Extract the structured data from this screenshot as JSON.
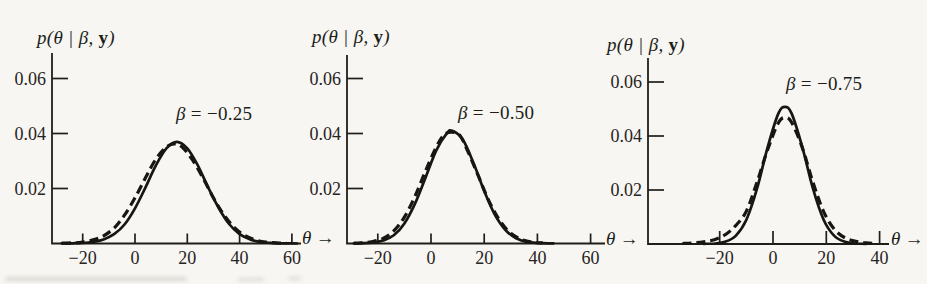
{
  "figure": {
    "background_color": "#f7f6f2",
    "ink_color": "#211e1a"
  },
  "chart_data": [
    {
      "type": "line",
      "title": "",
      "ylabel": "p(θ | β, y)",
      "xlabel": "θ →",
      "annotation": "β = −0.25",
      "grid": false,
      "legend": "none",
      "x_ticks": [
        -20,
        0,
        20,
        40,
        60
      ],
      "x_tick_labels": [
        "−20",
        "0",
        "20",
        "40",
        "60"
      ],
      "y_ticks": [
        0.02,
        0.04,
        0.06
      ],
      "y_tick_labels": [
        "0.02",
        "0.04",
        "0.06"
      ],
      "xlim": [
        -31,
        63
      ],
      "ylim": [
        0,
        0.069
      ],
      "labels": {
        "ylabel_prefix": "p(θ | β, ",
        "ylabel_bold": "y",
        "ylabel_suffix": ")",
        "annotation_sym": "β",
        "annotation_rest": " = −0.25",
        "x_arrow_sym": "θ",
        "x_arrow": "→"
      },
      "series": [
        {
          "name": "dashed-curve",
          "style": "dashed",
          "points": [
            [
              -28,
              0.0001
            ],
            [
              -24,
              0.0002
            ],
            [
              -20,
              0.0005
            ],
            [
              -16,
              0.0013
            ],
            [
              -12,
              0.0028
            ],
            [
              -8,
              0.0056
            ],
            [
              -4,
              0.0103
            ],
            [
              0,
              0.0166
            ],
            [
              4,
              0.0239
            ],
            [
              8,
              0.0307
            ],
            [
              12,
              0.0351
            ],
            [
              15,
              0.0362
            ],
            [
              18,
              0.0351
            ],
            [
              22,
              0.0304
            ],
            [
              26,
              0.0238
            ],
            [
              30,
              0.0166
            ],
            [
              34,
              0.0104
            ],
            [
              38,
              0.0058
            ],
            [
              42,
              0.0029
            ],
            [
              46,
              0.0013
            ],
            [
              50,
              0.0005
            ],
            [
              54,
              0.0002
            ],
            [
              58,
              6e-05
            ]
          ]
        },
        {
          "name": "solid-curve",
          "style": "solid",
          "points": [
            [
              -28,
              2e-05
            ],
            [
              -24,
              7e-05
            ],
            [
              -20,
              0.00018
            ],
            [
              -16,
              0.0006
            ],
            [
              -12,
              0.0015
            ],
            [
              -8,
              0.0034
            ],
            [
              -4,
              0.0069
            ],
            [
              0,
              0.0128
            ],
            [
              4,
              0.0204
            ],
            [
              8,
              0.0284
            ],
            [
              12,
              0.0346
            ],
            [
              16,
              0.037
            ],
            [
              20,
              0.0346
            ],
            [
              24,
              0.0284
            ],
            [
              28,
              0.0204
            ],
            [
              32,
              0.0129
            ],
            [
              36,
              0.0071
            ],
            [
              40,
              0.0034
            ],
            [
              44,
              0.0015
            ],
            [
              48,
              0.0005
            ],
            [
              52,
              0.0002
            ],
            [
              56,
              6e-05
            ],
            [
              60,
              2e-05
            ],
            [
              62,
              1e-05
            ]
          ]
        }
      ]
    },
    {
      "type": "line",
      "title": "",
      "ylabel": "p(θ | β, y)",
      "xlabel": "θ →",
      "annotation": "β = −0.50",
      "grid": false,
      "legend": "none",
      "x_ticks": [
        -20,
        0,
        20,
        40,
        60
      ],
      "x_tick_labels": [
        "−20",
        "0",
        "20",
        "40",
        "60"
      ],
      "y_ticks": [
        0.02,
        0.04,
        0.06
      ],
      "y_tick_labels": [
        "0.02",
        "0.04",
        "0.06"
      ],
      "xlim": [
        -31,
        65
      ],
      "ylim": [
        0,
        0.069
      ],
      "labels": {
        "ylabel_prefix": "p(θ | β, ",
        "ylabel_bold": "y",
        "ylabel_suffix": ")",
        "annotation_sym": "β",
        "annotation_rest": " = −0.50",
        "x_arrow_sym": "θ",
        "x_arrow": "→"
      },
      "series": [
        {
          "name": "dashed-curve",
          "style": "dashed",
          "points": [
            [
              -29,
              0.0001
            ],
            [
              -26,
              0.0002
            ],
            [
              -22,
              0.0007
            ],
            [
              -18,
              0.0019
            ],
            [
              -14,
              0.0046
            ],
            [
              -10,
              0.0096
            ],
            [
              -6,
              0.0172
            ],
            [
              -2,
              0.0265
            ],
            [
              2,
              0.0351
            ],
            [
              5,
              0.0396
            ],
            [
              8,
              0.0405
            ],
            [
              11,
              0.0391
            ],
            [
              14,
              0.0332
            ],
            [
              18,
              0.0241
            ],
            [
              22,
              0.015
            ],
            [
              26,
              0.0081
            ],
            [
              30,
              0.0037
            ],
            [
              34,
              0.0015
            ],
            [
              38,
              0.0005
            ],
            [
              42,
              0.0002
            ]
          ]
        },
        {
          "name": "solid-curve",
          "style": "solid",
          "points": [
            [
              -29,
              5e-05
            ],
            [
              -26,
              0.0001
            ],
            [
              -22,
              0.0003
            ],
            [
              -18,
              0.0011
            ],
            [
              -14,
              0.003
            ],
            [
              -10,
              0.0073
            ],
            [
              -6,
              0.0145
            ],
            [
              -2,
              0.0241
            ],
            [
              2,
              0.0339
            ],
            [
              6,
              0.0401
            ],
            [
              8,
              0.041
            ],
            [
              12,
              0.0377
            ],
            [
              16,
              0.0292
            ],
            [
              20,
              0.0191
            ],
            [
              24,
              0.0105
            ],
            [
              28,
              0.0049
            ],
            [
              32,
              0.0019
            ],
            [
              36,
              0.0006
            ],
            [
              40,
              0.0002
            ],
            [
              44,
              6e-05
            ],
            [
              46,
              3e-05
            ]
          ]
        }
      ]
    },
    {
      "type": "line",
      "title": "",
      "ylabel": "p(θ | β, y)",
      "xlabel": "θ →",
      "annotation": "β = −0.75",
      "grid": false,
      "legend": "none",
      "x_ticks": [
        -20,
        0,
        20,
        40
      ],
      "x_tick_labels": [
        "−20",
        "0",
        "20",
        "40"
      ],
      "y_ticks": [
        0.02,
        0.04,
        0.06
      ],
      "y_tick_labels": [
        "0.02",
        "0.04",
        "0.06"
      ],
      "xlim": [
        -47,
        43
      ],
      "ylim": [
        0,
        0.069
      ],
      "labels": {
        "ylabel_prefix": "p(θ | β, ",
        "ylabel_bold": "y",
        "ylabel_suffix": ")",
        "annotation_sym": "β",
        "annotation_rest": " = −0.75",
        "x_arrow_sym": "θ",
        "x_arrow": "→"
      },
      "series": [
        {
          "name": "dashed-curve",
          "style": "dashed",
          "points": [
            [
              -34,
              0.0002
            ],
            [
              -30,
              0.0004
            ],
            [
              -26,
              0.0008
            ],
            [
              -22,
              0.0016
            ],
            [
              -18,
              0.0034
            ],
            [
              -14,
              0.0068
            ],
            [
              -10,
              0.0122
            ],
            [
              -6,
              0.0229
            ],
            [
              -2,
              0.035
            ],
            [
              2,
              0.0448
            ],
            [
              4.5,
              0.0468
            ],
            [
              7,
              0.045
            ],
            [
              11,
              0.0357
            ],
            [
              15,
              0.0228
            ],
            [
              19,
              0.012
            ],
            [
              23,
              0.0055
            ],
            [
              27,
              0.0023
            ],
            [
              31,
              0.001
            ],
            [
              35,
              0.0004
            ],
            [
              39,
              0.0002
            ]
          ]
        },
        {
          "name": "solid-curve",
          "style": "solid",
          "points": [
            [
              -26,
              8e-05
            ],
            [
              -22,
              0.0002
            ],
            [
              -18,
              0.0008
            ],
            [
              -14,
              0.003
            ],
            [
              -10,
              0.009
            ],
            [
              -6,
              0.0205
            ],
            [
              -2,
              0.0359
            ],
            [
              2,
              0.0483
            ],
            [
              4.5,
              0.0508
            ],
            [
              7,
              0.0483
            ],
            [
              11,
              0.0359
            ],
            [
              15,
              0.0205
            ],
            [
              19,
              0.009
            ],
            [
              23,
              0.003
            ],
            [
              27,
              0.0008
            ],
            [
              31,
              0.0002
            ],
            [
              35,
              6e-05
            ]
          ]
        }
      ]
    }
  ]
}
